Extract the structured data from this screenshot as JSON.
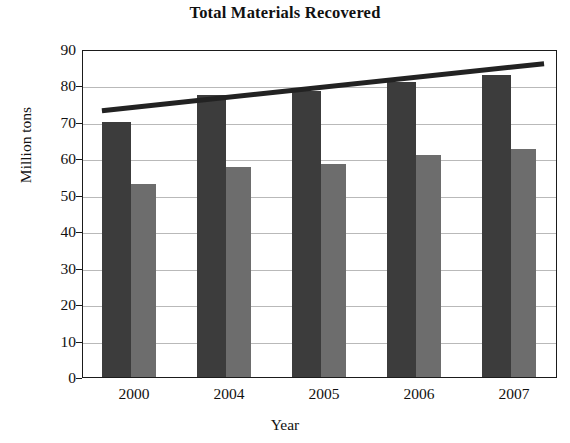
{
  "chart_data": {
    "type": "bar",
    "title": "Total Materials Recovered",
    "xlabel": "Year",
    "ylabel": "Million tons",
    "categories": [
      "2000",
      "2004",
      "2005",
      "2006",
      "2007"
    ],
    "ylim": [
      0,
      90
    ],
    "yticks": [
      0,
      10,
      20,
      30,
      40,
      50,
      60,
      70,
      80,
      90
    ],
    "grid": true,
    "legend": "none",
    "series": [
      {
        "name": "series-1-dark",
        "color": "#3c3c3c",
        "values": [
          69.9,
          77.5,
          78.5,
          81.0,
          83.0
        ]
      },
      {
        "name": "series-2-light",
        "color": "#6d6d6d",
        "values": [
          53.0,
          57.5,
          58.5,
          61.0,
          62.5
        ]
      }
    ],
    "trendline": {
      "name": "trend",
      "color": "#222222",
      "x_start_category_index": 0,
      "x_end_category_index": 4,
      "y_start": 73.5,
      "y_end": 86.5
    }
  },
  "axis": {
    "ytick_labels": [
      "90",
      "80",
      "70",
      "60",
      "50",
      "40",
      "30",
      "20",
      "10",
      "0"
    ],
    "xtick_labels": [
      "2000",
      "2004",
      "2005",
      "2006",
      "2007"
    ]
  }
}
